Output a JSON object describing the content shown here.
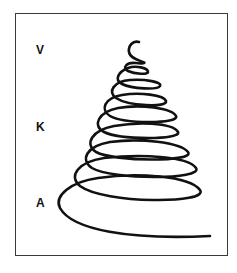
{
  "figure": {
    "labels": [
      {
        "text": "V",
        "position": "top"
      },
      {
        "text": "K",
        "position": "middle"
      },
      {
        "text": "A",
        "position": "bottom"
      }
    ],
    "spiral": {
      "description": "Hand-drawn conical spiral, widening from top to bottom",
      "stroke_color": "#111111",
      "loops": 7
    },
    "frame_color": "#3a3a3a",
    "background": "#ffffff"
  }
}
